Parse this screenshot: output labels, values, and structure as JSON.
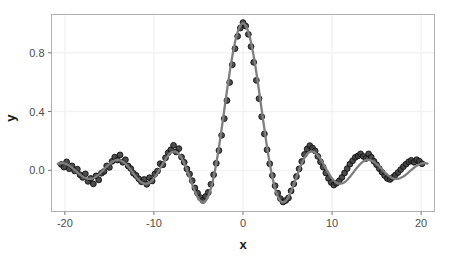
{
  "chart_data": {
    "type": "scatter",
    "title": "",
    "subtitle": "",
    "xlabel": "x",
    "ylabel": "y",
    "xlim": [
      -21.5,
      21.5
    ],
    "ylim": [
      -0.28,
      1.06
    ],
    "xticks": [
      -20,
      -10,
      0,
      10,
      20
    ],
    "xticklabels": [
      "-20",
      "-10",
      "0",
      "10",
      "20"
    ],
    "yticks": [
      0.0,
      0.4,
      0.8
    ],
    "yticklabels": [
      "0.0",
      "0.4",
      "0.8"
    ],
    "grid": true,
    "legend": null,
    "panel_background": "#ffffff",
    "panel_border": "#b3b3b3",
    "grid_color": "#f2f2f2",
    "point_color": "#3d3d3d",
    "point_edge_color": "#111111",
    "line_color": "#7f7f7f",
    "series": [
      {
        "name": "observed",
        "type": "scatter",
        "marker": "circle",
        "x": [
          -20.4,
          -20.1,
          -19.8,
          -19.5,
          -19.2,
          -18.9,
          -18.6,
          -18.3,
          -18.0,
          -17.7,
          -17.4,
          -17.1,
          -16.8,
          -16.5,
          -16.2,
          -15.9,
          -15.6,
          -15.3,
          -15.0,
          -14.7,
          -14.4,
          -14.1,
          -13.8,
          -13.5,
          -13.2,
          -12.9,
          -12.6,
          -12.3,
          -12.0,
          -11.7,
          -11.4,
          -11.1,
          -10.8,
          -10.5,
          -10.2,
          -9.9,
          -9.6,
          -9.3,
          -9.0,
          -8.7,
          -8.4,
          -8.1,
          -7.8,
          -7.5,
          -7.2,
          -6.9,
          -6.6,
          -6.3,
          -6.0,
          -5.7,
          -5.4,
          -5.1,
          -4.8,
          -4.5,
          -4.2,
          -3.9,
          -3.6,
          -3.3,
          -3.0,
          -2.7,
          -2.4,
          -2.1,
          -1.8,
          -1.5,
          -1.2,
          -0.9,
          -0.6,
          -0.3,
          0.0,
          0.3,
          0.6,
          0.9,
          1.2,
          1.5,
          1.8,
          2.1,
          2.4,
          2.7,
          3.0,
          3.3,
          3.6,
          3.9,
          4.2,
          4.5,
          4.8,
          5.1,
          5.4,
          5.7,
          6.0,
          6.3,
          6.6,
          6.9,
          7.2,
          7.5,
          7.8,
          8.1,
          8.4,
          8.7,
          9.0,
          9.3,
          9.6,
          9.9,
          10.2,
          10.5,
          10.8,
          11.1,
          11.4,
          11.7,
          12.0,
          12.3,
          12.6,
          12.9,
          13.2,
          13.5,
          13.8,
          14.1,
          14.4,
          14.7,
          15.0,
          15.3,
          15.6,
          15.9,
          16.2,
          16.5,
          16.8,
          17.1,
          17.4,
          17.7,
          18.0,
          18.3,
          18.6,
          18.9,
          19.2,
          19.5,
          19.8,
          20.1
        ],
        "y": [
          0.04,
          0.022,
          0.058,
          0.011,
          0.03,
          -0.004,
          0.008,
          -0.03,
          -0.048,
          -0.024,
          -0.075,
          -0.055,
          -0.092,
          -0.038,
          -0.065,
          -0.02,
          -0.008,
          0.03,
          0.02,
          0.061,
          0.09,
          0.07,
          0.105,
          0.055,
          0.072,
          0.03,
          0.012,
          -0.02,
          -0.035,
          -0.058,
          -0.078,
          -0.062,
          -0.095,
          -0.05,
          -0.072,
          -0.025,
          -0.005,
          0.045,
          0.038,
          0.085,
          0.12,
          0.14,
          0.17,
          0.125,
          0.148,
          0.09,
          0.055,
          0.01,
          -0.025,
          -0.07,
          -0.12,
          -0.155,
          -0.185,
          -0.205,
          -0.178,
          -0.15,
          -0.095,
          -0.03,
          0.048,
          0.135,
          0.238,
          0.352,
          0.475,
          0.598,
          0.718,
          0.828,
          0.912,
          0.968,
          1.005,
          0.982,
          0.925,
          0.842,
          0.735,
          0.612,
          0.488,
          0.365,
          0.248,
          0.14,
          0.045,
          -0.035,
          -0.105,
          -0.155,
          -0.192,
          -0.215,
          -0.205,
          -0.188,
          -0.14,
          -0.092,
          -0.042,
          0.01,
          0.06,
          0.108,
          0.145,
          0.168,
          0.152,
          0.132,
          0.095,
          0.058,
          0.022,
          -0.018,
          -0.055,
          -0.082,
          -0.1,
          -0.088,
          -0.072,
          -0.048,
          -0.018,
          0.012,
          0.042,
          0.065,
          0.088,
          0.098,
          0.112,
          0.095,
          0.08,
          0.112,
          0.09,
          0.062,
          0.038,
          0.012,
          -0.012,
          -0.035,
          -0.055,
          -0.062,
          -0.048,
          -0.032,
          -0.015,
          0.005,
          0.025,
          0.042,
          0.058,
          0.068,
          0.055,
          0.072,
          0.062,
          0.045
        ]
      },
      {
        "name": "smooth-fit",
        "type": "line",
        "description": "fitted sinc curve sin(x)/x"
      }
    ]
  },
  "axes": {
    "x_title": "x",
    "y_title": "y"
  }
}
